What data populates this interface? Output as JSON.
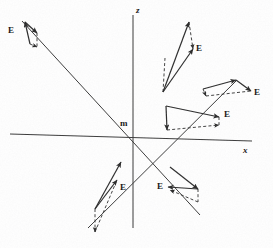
{
  "figure": {
    "type": "vector-field-diagram",
    "title": "",
    "origin_label": "m",
    "background_color": "#fefefe",
    "stroke_color": "#2b2b2b",
    "width": 273,
    "height": 248
  },
  "axes": [
    {
      "name": "z-axis",
      "label": "z",
      "label_x": 136,
      "label_y": 6,
      "x1": 133,
      "y1": 15,
      "x2": 133,
      "y2": 228
    },
    {
      "name": "x-axis",
      "label": "x",
      "label_x": 243,
      "label_y": 146,
      "x1": 10,
      "y1": 134,
      "x2": 252,
      "y2": 141
    },
    {
      "name": "diagonal-axis-nw-se",
      "label": "",
      "label_x": 0,
      "label_y": 0,
      "x1": 22,
      "y1": 21,
      "x2": 200,
      "y2": 215
    },
    {
      "name": "diagonal-axis-sw-ne",
      "label": "",
      "label_x": 0,
      "label_y": 0,
      "x1": 88,
      "y1": 228,
      "x2": 237,
      "y2": 80
    }
  ],
  "origin": {
    "x": 133,
    "y": 137,
    "label": "m",
    "label_x": 120,
    "label_y": 119
  },
  "vector_groups": [
    {
      "name": "vector-group-upper-left",
      "label": "E",
      "label_x": 8,
      "label_y": 26,
      "solid_arrow": {
        "x1": 30,
        "y1": 44,
        "x2": 25,
        "y2": 22
      },
      "component_arrow": {
        "x1": 25,
        "y1": 22,
        "x2": 37,
        "y2": 33
      },
      "dashed_arrow": {
        "x1": 30,
        "y1": 44,
        "x2": 37,
        "y2": 47
      },
      "dashed_leg": {
        "x1": 37,
        "y1": 33,
        "x2": 37,
        "y2": 47
      }
    },
    {
      "name": "vector-group-upper-right",
      "label": "E",
      "label_x": 196,
      "label_y": 44,
      "solid_arrow": {
        "x1": 163,
        "y1": 92,
        "x2": 193,
        "y2": 49
      },
      "component_arrow": {
        "x1": 163,
        "y1": 92,
        "x2": 189,
        "y2": 22
      },
      "dashed_arrow": {
        "x1": 189,
        "y1": 22,
        "x2": 193,
        "y2": 49
      },
      "dashed_leg": {
        "x1": 163,
        "y1": 92,
        "x2": 165,
        "y2": 58
      }
    },
    {
      "name": "vector-group-right-upper",
      "label": "E",
      "label_x": 254,
      "label_y": 88,
      "solid_arrow": {
        "x1": 203,
        "y1": 89,
        "x2": 236,
        "y2": 80
      },
      "component_arrow": {
        "x1": 236,
        "y1": 80,
        "x2": 251,
        "y2": 91
      },
      "dashed_arrow": {
        "x1": 203,
        "y1": 89,
        "x2": 206,
        "y2": 96
      },
      "dashed_leg": {
        "x1": 206,
        "y1": 96,
        "x2": 251,
        "y2": 91
      }
    },
    {
      "name": "vector-group-right-lower",
      "label": "E",
      "label_x": 224,
      "label_y": 110,
      "solid_arrow": {
        "x1": 166,
        "y1": 106,
        "x2": 219,
        "y2": 117
      },
      "component_arrow": {
        "x1": 166,
        "y1": 106,
        "x2": 167,
        "y2": 130
      },
      "dashed_arrow": {
        "x1": 167,
        "y1": 130,
        "x2": 219,
        "y2": 125
      },
      "dashed_leg": {
        "x1": 219,
        "y1": 117,
        "x2": 219,
        "y2": 125
      }
    },
    {
      "name": "vector-group-lower-left",
      "label": "E",
      "label_x": 120,
      "label_y": 183,
      "solid_arrow": {
        "x1": 95,
        "y1": 209,
        "x2": 117,
        "y2": 180
      },
      "component_arrow": {
        "x1": 95,
        "y1": 209,
        "x2": 121,
        "y2": 162
      },
      "dashed_arrow": {
        "x1": 95,
        "y1": 209,
        "x2": 95,
        "y2": 232
      },
      "dashed_leg": {
        "x1": 95,
        "y1": 232,
        "x2": 117,
        "y2": 180
      }
    },
    {
      "name": "vector-group-lower-right",
      "label": "E",
      "label_x": 157,
      "label_y": 182,
      "solid_arrow": {
        "x1": 198,
        "y1": 189,
        "x2": 168,
        "y2": 187
      },
      "component_arrow": {
        "x1": 170,
        "y1": 167,
        "x2": 198,
        "y2": 189
      },
      "dashed_arrow": {
        "x1": 198,
        "y1": 202,
        "x2": 170,
        "y2": 190
      },
      "dashed_leg": {
        "x1": 198,
        "y1": 189,
        "x2": 198,
        "y2": 202
      }
    }
  ]
}
